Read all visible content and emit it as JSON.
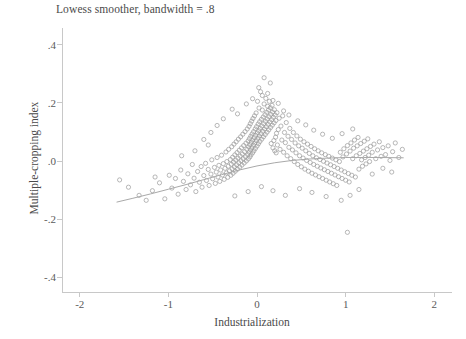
{
  "chart_data": {
    "type": "scatter",
    "title": "Lowess smoother, bandwidth = .8",
    "xlabel": "Industrialization",
    "ylabel": "Multiple-cropping index",
    "xlim": [
      -2.2,
      2.2
    ],
    "ylim": [
      -0.45,
      0.45
    ],
    "xticks": [
      -2,
      -1,
      0,
      1,
      2
    ],
    "xtick_labels": [
      "-2",
      "-1",
      "0",
      "1",
      "2"
    ],
    "yticks": [
      0.4,
      0.2,
      0.0,
      -0.2,
      -0.4
    ],
    "ytick_labels": [
      ".4",
      ".2",
      ".0",
      "-.2",
      "-.4"
    ],
    "grid": false,
    "legend": "none",
    "marker": "open-circle",
    "marker_color": "#9a9a9a",
    "line_color": "#a9a9a9",
    "smoother": {
      "name": "lowess",
      "bandwidth": 0.8,
      "x": [
        -1.58,
        -1.4,
        -1.2,
        -1.0,
        -0.8,
        -0.6,
        -0.4,
        -0.2,
        0.0,
        0.2,
        0.4,
        0.6,
        0.8,
        1.0,
        1.2,
        1.4,
        1.65
      ],
      "y": [
        -0.141,
        -0.128,
        -0.113,
        -0.097,
        -0.081,
        -0.064,
        -0.047,
        -0.031,
        -0.017,
        -0.006,
        0.002,
        0.007,
        0.01,
        0.012,
        0.012,
        0.012,
        0.011
      ]
    },
    "points": [
      [
        -1.55,
        -0.065
      ],
      [
        -1.33,
        -0.118
      ],
      [
        -1.18,
        -0.102
      ],
      [
        -1.1,
        -0.075
      ],
      [
        -1.04,
        -0.13
      ],
      [
        -0.99,
        -0.049
      ],
      [
        -0.96,
        -0.093
      ],
      [
        -0.92,
        -0.06
      ],
      [
        -0.89,
        -0.114
      ],
      [
        -0.86,
        -0.031
      ],
      [
        -0.83,
        -0.07
      ],
      [
        -0.8,
        -0.098
      ],
      [
        -0.78,
        -0.044
      ],
      [
        -0.75,
        -0.082
      ],
      [
        -0.73,
        -0.012
      ],
      [
        -0.71,
        -0.059
      ],
      [
        -0.69,
        -0.105
      ],
      [
        -0.67,
        -0.036
      ],
      [
        -0.65,
        -0.073
      ],
      [
        -0.63,
        -0.019
      ],
      [
        -0.62,
        -0.09
      ],
      [
        -0.6,
        -0.05
      ],
      [
        -0.58,
        -0.008
      ],
      [
        -0.57,
        -0.067
      ],
      [
        -0.55,
        -0.029
      ],
      [
        -0.54,
        -0.084
      ],
      [
        -0.52,
        -0.045
      ],
      [
        -0.51,
        0.004
      ],
      [
        -0.5,
        -0.061
      ],
      [
        -0.48,
        -0.022
      ],
      [
        -0.47,
        -0.077
      ],
      [
        -0.46,
        -0.038
      ],
      [
        -0.45,
        0.012
      ],
      [
        -0.44,
        -0.055
      ],
      [
        -0.43,
        -0.015
      ],
      [
        -0.42,
        -0.07
      ],
      [
        -0.41,
        -0.031
      ],
      [
        -0.4,
        0.02
      ],
      [
        -0.39,
        -0.048
      ],
      [
        -0.38,
        -0.009
      ],
      [
        -0.37,
        -0.063
      ],
      [
        -0.36,
        -0.025
      ],
      [
        -0.35,
        0.031
      ],
      [
        -0.345,
        -0.041
      ],
      [
        -0.34,
        -0.002
      ],
      [
        -0.33,
        -0.056
      ],
      [
        -0.325,
        -0.018
      ],
      [
        -0.32,
        0.04
      ],
      [
        -0.31,
        -0.034
      ],
      [
        -0.3,
        0.005
      ],
      [
        -0.295,
        -0.049
      ],
      [
        -0.29,
        -0.011
      ],
      [
        -0.285,
        0.049
      ],
      [
        -0.28,
        -0.027
      ],
      [
        -0.275,
        0.013
      ],
      [
        -0.27,
        -0.042
      ],
      [
        -0.265,
        -0.004
      ],
      [
        -0.26,
        0.058
      ],
      [
        -0.255,
        -0.02
      ],
      [
        -0.25,
        0.021
      ],
      [
        -0.245,
        -0.035
      ],
      [
        -0.24,
        0.003
      ],
      [
        -0.235,
        0.066
      ],
      [
        -0.23,
        -0.013
      ],
      [
        -0.225,
        0.029
      ],
      [
        -0.22,
        -0.028
      ],
      [
        -0.215,
        0.01
      ],
      [
        -0.21,
        0.075
      ],
      [
        -0.205,
        -0.006
      ],
      [
        -0.2,
        0.037
      ],
      [
        -0.195,
        -0.021
      ],
      [
        -0.19,
        0.017
      ],
      [
        -0.185,
        0.083
      ],
      [
        -0.18,
        0.001
      ],
      [
        -0.175,
        0.045
      ],
      [
        -0.17,
        -0.014
      ],
      [
        -0.165,
        0.024
      ],
      [
        -0.16,
        0.092
      ],
      [
        -0.155,
        0.008
      ],
      [
        -0.15,
        0.053
      ],
      [
        -0.145,
        -0.007
      ],
      [
        -0.14,
        0.032
      ],
      [
        -0.135,
        0.101
      ],
      [
        -0.13,
        0.015
      ],
      [
        -0.125,
        0.061
      ],
      [
        -0.12,
        0.0
      ],
      [
        -0.115,
        0.04
      ],
      [
        -0.11,
        0.11
      ],
      [
        -0.105,
        0.022
      ],
      [
        -0.1,
        0.069
      ],
      [
        -0.098,
        0.007
      ],
      [
        -0.095,
        0.048
      ],
      [
        -0.09,
        0.119
      ],
      [
        -0.088,
        0.03
      ],
      [
        -0.085,
        0.077
      ],
      [
        -0.08,
        0.014
      ],
      [
        -0.078,
        0.056
      ],
      [
        -0.075,
        0.128
      ],
      [
        -0.072,
        0.038
      ],
      [
        -0.07,
        0.085
      ],
      [
        -0.068,
        0.021
      ],
      [
        -0.065,
        0.064
      ],
      [
        -0.06,
        0.137
      ],
      [
        -0.058,
        0.046
      ],
      [
        -0.055,
        0.093
      ],
      [
        -0.05,
        0.028
      ],
      [
        -0.048,
        0.072
      ],
      [
        -0.045,
        0.146
      ],
      [
        -0.04,
        0.054
      ],
      [
        -0.038,
        0.101
      ],
      [
        -0.035,
        0.035
      ],
      [
        -0.03,
        0.08
      ],
      [
        -0.028,
        0.155
      ],
      [
        -0.025,
        0.062
      ],
      [
        -0.02,
        0.11
      ],
      [
        -0.018,
        0.043
      ],
      [
        -0.015,
        0.088
      ],
      [
        -0.01,
        0.165
      ],
      [
        -0.008,
        0.07
      ],
      [
        -0.005,
        0.118
      ],
      [
        0.0,
        0.051
      ],
      [
        0.003,
        0.096
      ],
      [
        0.006,
        0.205
      ],
      [
        0.01,
        0.078
      ],
      [
        0.013,
        0.127
      ],
      [
        0.016,
        0.059
      ],
      [
        0.02,
        0.104
      ],
      [
        0.023,
        0.182
      ],
      [
        0.026,
        0.086
      ],
      [
        0.03,
        0.135
      ],
      [
        0.033,
        0.067
      ],
      [
        0.036,
        0.112
      ],
      [
        0.04,
        0.238
      ],
      [
        0.045,
        0.094
      ],
      [
        0.05,
        0.143
      ],
      [
        0.053,
        0.075
      ],
      [
        0.056,
        0.12
      ],
      [
        0.06,
        0.175
      ],
      [
        0.065,
        0.102
      ],
      [
        0.07,
        0.151
      ],
      [
        0.073,
        0.083
      ],
      [
        0.076,
        0.128
      ],
      [
        0.08,
        0.196
      ],
      [
        0.085,
        0.11
      ],
      [
        0.09,
        0.159
      ],
      [
        0.093,
        0.091
      ],
      [
        0.096,
        0.136
      ],
      [
        0.1,
        0.215
      ],
      [
        0.105,
        0.118
      ],
      [
        0.11,
        0.167
      ],
      [
        0.113,
        0.099
      ],
      [
        0.116,
        0.144
      ],
      [
        0.12,
        0.188
      ],
      [
        0.125,
        0.126
      ],
      [
        0.13,
        0.175
      ],
      [
        0.133,
        0.107
      ],
      [
        0.136,
        0.152
      ],
      [
        0.14,
        0.205
      ],
      [
        0.145,
        0.134
      ],
      [
        0.15,
        0.183
      ],
      [
        0.153,
        0.115
      ],
      [
        0.156,
        0.16
      ],
      [
        0.16,
        0.06
      ],
      [
        0.165,
        0.142
      ],
      [
        0.17,
        0.191
      ],
      [
        0.173,
        0.123
      ],
      [
        0.176,
        0.168
      ],
      [
        0.18,
        0.045
      ],
      [
        0.185,
        0.15
      ],
      [
        0.19,
        0.07
      ],
      [
        0.193,
        0.131
      ],
      [
        0.196,
        0.176
      ],
      [
        0.2,
        0.035
      ],
      [
        0.205,
        0.158
      ],
      [
        0.21,
        0.082
      ],
      [
        0.213,
        0.139
      ],
      [
        0.216,
        0.028
      ],
      [
        0.22,
        0.095
      ],
      [
        0.225,
        0.166
      ],
      [
        0.23,
        0.055
      ],
      [
        0.24,
        0.108
      ],
      [
        0.25,
        0.147
      ],
      [
        0.26,
        0.04
      ],
      [
        0.27,
        0.12
      ],
      [
        0.28,
        0.072
      ],
      [
        0.29,
        0.155
      ],
      [
        0.3,
        0.03
      ],
      [
        0.31,
        0.098
      ],
      [
        0.32,
        0.063
      ],
      [
        0.33,
        0.132
      ],
      [
        0.34,
        0.018
      ],
      [
        0.35,
        0.085
      ],
      [
        0.36,
        0.047
      ],
      [
        0.37,
        0.112
      ],
      [
        0.38,
        0.008
      ],
      [
        0.39,
        0.074
      ],
      [
        0.4,
        0.038
      ],
      [
        0.41,
        0.098
      ],
      [
        0.42,
        -0.002
      ],
      [
        0.43,
        0.062
      ],
      [
        0.44,
        0.028
      ],
      [
        0.45,
        0.086
      ],
      [
        0.46,
        -0.012
      ],
      [
        0.47,
        0.052
      ],
      [
        0.48,
        0.018
      ],
      [
        0.49,
        0.075
      ],
      [
        0.5,
        -0.02
      ],
      [
        0.51,
        0.044
      ],
      [
        0.52,
        0.01
      ],
      [
        0.53,
        0.066
      ],
      [
        0.54,
        -0.028
      ],
      [
        0.55,
        0.035
      ],
      [
        0.56,
        0.002
      ],
      [
        0.57,
        0.058
      ],
      [
        0.58,
        -0.035
      ],
      [
        0.59,
        0.026
      ],
      [
        0.6,
        -0.005
      ],
      [
        0.61,
        0.05
      ],
      [
        0.62,
        -0.042
      ],
      [
        0.63,
        0.018
      ],
      [
        0.64,
        -0.012
      ],
      [
        0.65,
        0.042
      ],
      [
        0.66,
        -0.048
      ],
      [
        0.67,
        0.011
      ],
      [
        0.68,
        -0.018
      ],
      [
        0.69,
        0.035
      ],
      [
        0.7,
        -0.054
      ],
      [
        0.71,
        0.005
      ],
      [
        0.72,
        -0.024
      ],
      [
        0.73,
        0.028
      ],
      [
        0.74,
        -0.06
      ],
      [
        0.75,
        -0.001
      ],
      [
        0.76,
        -0.03
      ],
      [
        0.77,
        0.022
      ],
      [
        0.78,
        -0.066
      ],
      [
        0.79,
        -0.007
      ],
      [
        0.8,
        -0.036
      ],
      [
        0.81,
        0.016
      ],
      [
        0.82,
        -0.072
      ],
      [
        0.83,
        -0.013
      ],
      [
        0.84,
        -0.042
      ],
      [
        0.85,
        0.01
      ],
      [
        0.86,
        -0.078
      ],
      [
        0.87,
        -0.019
      ],
      [
        0.88,
        -0.048
      ],
      [
        0.89,
        0.004
      ],
      [
        0.9,
        -0.084
      ],
      [
        0.91,
        -0.025
      ],
      [
        0.92,
        -0.054
      ],
      [
        0.93,
        -0.002
      ],
      [
        0.94,
        0.03
      ],
      [
        0.95,
        -0.031
      ],
      [
        0.96,
        -0.06
      ],
      [
        0.97,
        0.014
      ],
      [
        0.98,
        0.042
      ],
      [
        0.99,
        -0.037
      ],
      [
        1.0,
        -0.066
      ],
      [
        1.01,
        0.024
      ],
      [
        1.02,
        0.053
      ],
      [
        1.03,
        -0.043
      ],
      [
        1.04,
        -0.072
      ],
      [
        1.05,
        0.034
      ],
      [
        1.06,
        0.062
      ],
      [
        1.07,
        -0.049
      ],
      [
        1.08,
        0.008
      ],
      [
        1.09,
        0.044
      ],
      [
        1.1,
        0.072
      ],
      [
        1.11,
        -0.055
      ],
      [
        1.12,
        0.018
      ],
      [
        1.13,
        0.052
      ],
      [
        1.14,
        0.081
      ],
      [
        1.15,
        -0.028
      ],
      [
        1.16,
        0.026
      ],
      [
        1.17,
        0.06
      ],
      [
        1.18,
        0.004
      ],
      [
        1.19,
        -0.018
      ],
      [
        1.2,
        0.034
      ],
      [
        1.21,
        0.068
      ],
      [
        1.22,
        0.012
      ],
      [
        1.23,
        -0.01
      ],
      [
        1.24,
        0.042
      ],
      [
        1.25,
        0.076
      ],
      [
        1.26,
        0.02
      ],
      [
        1.27,
        -0.002
      ],
      [
        1.28,
        0.05
      ],
      [
        1.3,
        0.03
      ],
      [
        1.32,
        0.058
      ],
      [
        1.34,
        0.008
      ],
      [
        1.36,
        0.038
      ],
      [
        1.38,
        0.066
      ],
      [
        1.4,
        0.016
      ],
      [
        1.42,
        0.046
      ],
      [
        1.45,
        0.022
      ],
      [
        1.48,
        0.052
      ],
      [
        1.5,
        0.002
      ],
      [
        1.53,
        0.032
      ],
      [
        1.56,
        0.062
      ],
      [
        1.6,
        0.012
      ],
      [
        1.64,
        0.04
      ],
      [
        -0.28,
        0.178
      ],
      [
        -0.22,
        0.162
      ],
      [
        -0.12,
        0.196
      ],
      [
        -0.05,
        0.214
      ],
      [
        0.02,
        0.252
      ],
      [
        0.06,
        0.225
      ],
      [
        0.12,
        0.232
      ],
      [
        0.18,
        0.208
      ],
      [
        0.24,
        0.198
      ],
      [
        0.3,
        0.172
      ],
      [
        0.36,
        0.158
      ],
      [
        0.08,
        0.286
      ],
      [
        0.15,
        0.268
      ],
      [
        -0.38,
        0.145
      ],
      [
        -0.45,
        0.122
      ],
      [
        -0.52,
        0.098
      ],
      [
        -0.6,
        0.074
      ],
      [
        0.46,
        0.138
      ],
      [
        0.55,
        0.124
      ],
      [
        0.64,
        0.106
      ],
      [
        0.74,
        0.092
      ],
      [
        0.85,
        0.078
      ],
      [
        0.96,
        0.094
      ],
      [
        1.08,
        0.11
      ],
      [
        0.32,
        -0.118
      ],
      [
        0.18,
        -0.102
      ],
      [
        0.05,
        -0.088
      ],
      [
        -0.1,
        -0.105
      ],
      [
        -0.25,
        -0.12
      ],
      [
        0.48,
        -0.095
      ],
      [
        0.62,
        -0.108
      ],
      [
        0.78,
        -0.122
      ],
      [
        0.95,
        -0.135
      ],
      [
        1.05,
        -0.118
      ],
      [
        1.15,
        -0.098
      ],
      [
        1.02,
        -0.245
      ],
      [
        -1.45,
        -0.09
      ],
      [
        -1.25,
        -0.135
      ],
      [
        -1.15,
        -0.055
      ],
      [
        -0.55,
        0.055
      ],
      [
        -0.7,
        0.035
      ],
      [
        -0.85,
        0.018
      ],
      [
        1.3,
        -0.045
      ],
      [
        1.42,
        -0.025
      ],
      [
        1.52,
        -0.038
      ]
    ]
  }
}
